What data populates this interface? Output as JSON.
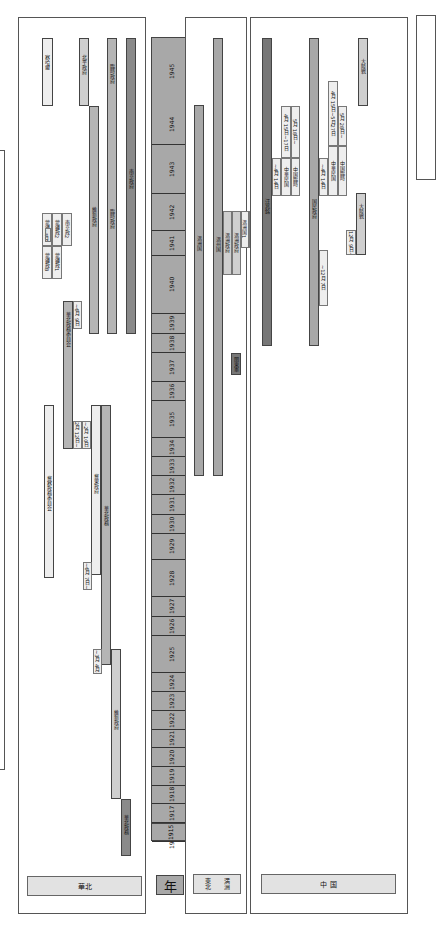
{
  "axis": {
    "label": "年",
    "years": [
      "1945",
      "1944",
      "1943",
      "1942",
      "1941",
      "1940",
      "1939",
      "1938",
      "1937",
      "1936",
      "1935",
      "1934",
      "1933",
      "1932",
      "1931",
      "1930",
      "1929",
      "1928",
      "1927",
      "1926",
      "1925",
      "1924",
      "1923",
      "1922",
      "1921",
      "1920",
      "1919",
      "1918",
      "1917",
      "1916",
      "1915"
    ]
  },
  "panels": {
    "left": {
      "label": "華北",
      "bars": [
        {
          "label": "華北政務",
          "note": ""
        },
        {
          "label": "冀東政府",
          "note": ""
        },
        {
          "label": "臨時政府",
          "note": ""
        },
        {
          "label": "維新政府",
          "note": ""
        },
        {
          "label": "華北政務委員会",
          "note": ""
        },
        {
          "label": "冀察政務委員会",
          "note": ""
        },
        {
          "label": "北平政府",
          "note": ""
        },
        {
          "label": "察哈爾",
          "note": ""
        },
        {
          "label": "南京政府",
          "note": ""
        }
      ],
      "notes": [
        "~6月 7日~",
        "~3月 4月~",
        "2月 12日~",
        "~2月 10日",
        "~6月 9日",
        "~5月"
      ],
      "small_boxes": [
        "蒙疆政A",
        "蒙疆政B",
        "蒙疆政2",
        "蒙疆政1",
        "蒙疆政",
        "南京政2"
      ]
    },
    "middle": {
      "label": "満洲",
      "sublabel": "東北",
      "bars": [
        {
          "label": "満洲国"
        },
        {
          "label": "満州国"
        },
        {
          "label": "関東軍"
        }
      ],
      "small_boxes": [
        "満洲政府",
        "満洲政府",
        "満洲国1",
        "満洲国2"
      ]
    },
    "right": {
      "label": "中 国",
      "bars": [
        {
          "label": "汪兆銘"
        },
        {
          "label": "国民政府"
        },
        {
          "label": "大陸戦"
        }
      ],
      "notes": [
        "~4月 14日",
        "4月 15日~17日",
        "5月 18日~",
        "~4月 14日",
        "4月 15日~5月27日",
        "5月 28日~",
        "~12月 7日",
        "12月 9日~"
      ],
      "small_boxes": [
        "中華民国",
        "中華民国",
        "中国臨時",
        "中国臨時"
      ]
    }
  }
}
